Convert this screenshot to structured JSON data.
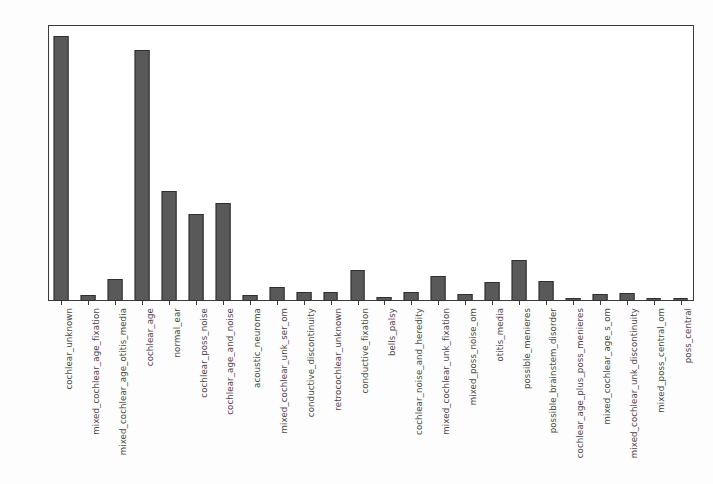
{
  "chart_data": {
    "type": "bar",
    "title": "",
    "xlabel": "",
    "ylabel": "",
    "ylim": [
      0,
      50
    ],
    "yticks": [
      0,
      10,
      20,
      30,
      40,
      50
    ],
    "grid": false,
    "legend": null,
    "bar_color": "#595959",
    "bar_edge_color": "#2f2f2f",
    "axis_color": "#3b3b3b",
    "background_color": "#ffffff",
    "categories": [
      "cochlear_unknown",
      "mixed_cochlear_age_fixation",
      "mixed_cochlear_age_otitis_media",
      "cochlear_age",
      "normal_ear",
      "cochlear_poss_noise",
      "cochlear_age_and_noise",
      "acoustic_neuroma",
      "mixed_cochlear_unk_ser_om",
      "conductive_discontinuity",
      "retrocochlear_unknown",
      "conductive_fixation",
      "bells_palsy",
      "cochlear_noise_and_heredity",
      "mixed_cochlear_unk_fixation",
      "mixed_poss_noise_om",
      "otitis_media",
      "possible_menieres",
      "possible_brainstem_disorder",
      "cochlear_age_plus_poss_menieres",
      "mixed_cochlear_age_s_om",
      "mixed_cochlear_unk_discontinuity",
      "mixed_poss_central_om",
      "poss_central"
    ],
    "values": [
      48,
      1,
      4,
      45.5,
      20,
      15.8,
      17.7,
      1,
      2.6,
      1.6,
      1.6,
      5.6,
      0.7,
      1.6,
      4.6,
      1.3,
      3.4,
      7.5,
      3.6,
      0.6,
      1.3,
      1.5,
      0.6,
      0.6
    ]
  }
}
